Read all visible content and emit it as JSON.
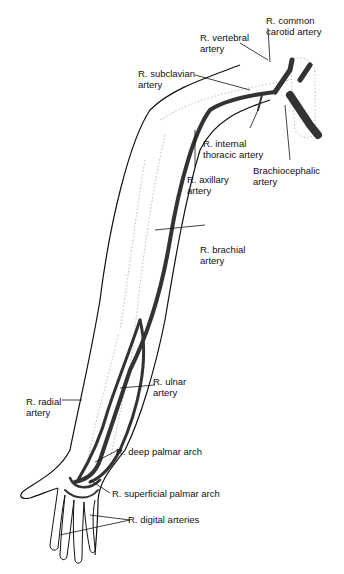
{
  "diagram": {
    "labels": {
      "common_carotid": "R. common\ncarotid artery",
      "vertebral": "R. vertebral\nartery",
      "subclavian": "R. subclavian\nartery",
      "internal_thoracic": "R. internal\nthoracic artery",
      "brachiocephalic": "Brachiocephalic\nartery",
      "axillary": "R. axillary\nartery",
      "brachial": "R. brachial\nartery",
      "ulnar": "R. ulnar\nartery",
      "radial": "R. radial\nartery",
      "deep_palmar": "R. deep palmar arch",
      "superficial_palmar": "R. superficial palmar arch",
      "digital": "R. digital arteries"
    },
    "colors": {
      "artery": "#333333",
      "outline": "#111111",
      "bone": "#bbbbbb"
    }
  }
}
